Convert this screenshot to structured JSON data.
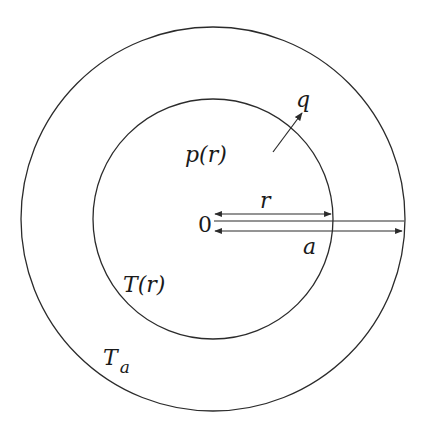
{
  "diagram": {
    "colors": {
      "stroke": "#2b2b2b",
      "text": "#1a1a1a",
      "background": "#ffffff"
    },
    "outer_circle": {
      "label": "T",
      "label_sub": "a",
      "cx": 213,
      "cy": 219,
      "r": 192
    },
    "inner_circle": {
      "label": "T(r)",
      "cx": 213,
      "cy": 219,
      "r": 120
    },
    "interior_label": "p(r)",
    "flux_arrow": {
      "label": "q"
    },
    "origin_label": "0",
    "radius_r_label": "r",
    "radius_a_label": "a"
  }
}
